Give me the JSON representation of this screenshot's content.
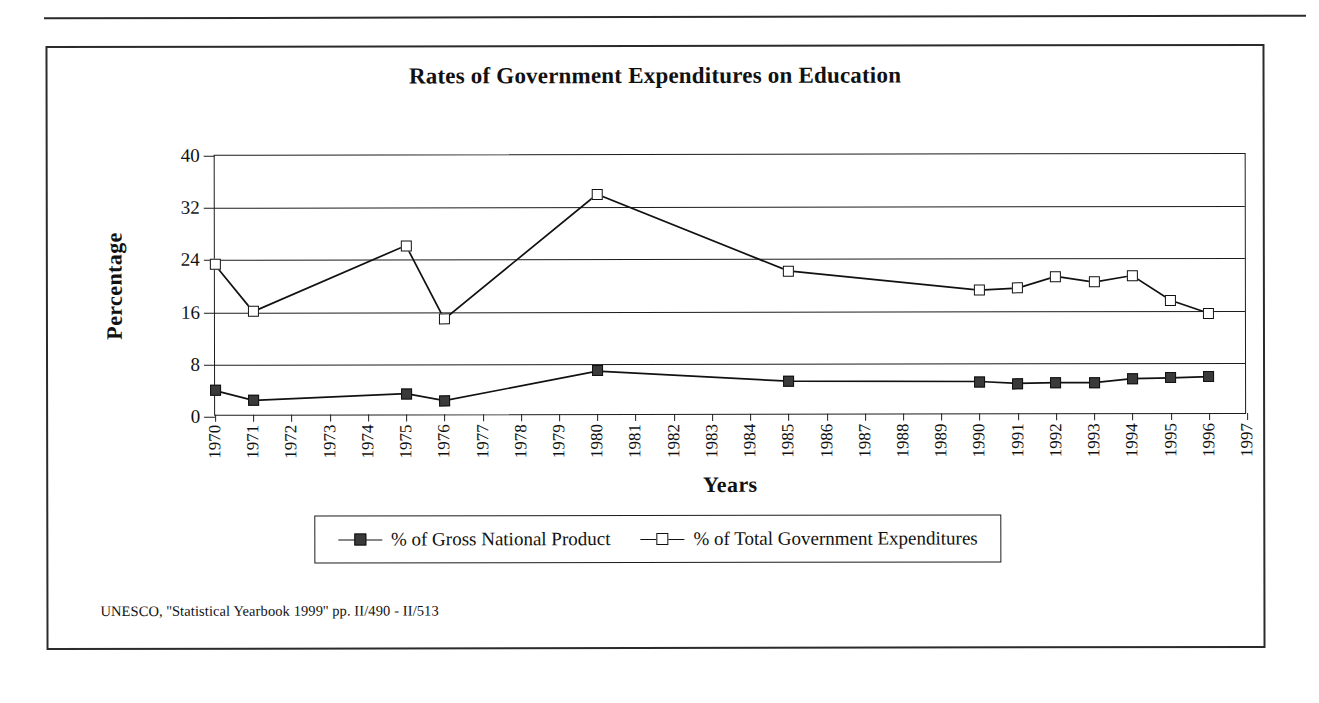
{
  "document": {
    "source_note": "UNESCO, ''Statistical Yearbook 1999'' pp. II/490 - II/513"
  },
  "chart_data": {
    "type": "line",
    "title": "Rates of Government Expenditures on Education",
    "xlabel": "Years",
    "ylabel": "Percentage",
    "ylim": [
      0,
      40
    ],
    "yticks": [
      0,
      8,
      16,
      24,
      32,
      40
    ],
    "grid": true,
    "legend_position": "bottom",
    "categories": [
      "1970",
      "1971",
      "1972",
      "1973",
      "1974",
      "1975",
      "1976",
      "1977",
      "1978",
      "1979",
      "1980",
      "1981",
      "1982",
      "1983",
      "1984",
      "1985",
      "1986",
      "1987",
      "1988",
      "1989",
      "1990",
      "1991",
      "1992",
      "1993",
      "1994",
      "1995",
      "1996",
      "1997"
    ],
    "series": [
      {
        "name": "% of Gross National Product",
        "marker": "filled-square",
        "color": "#3a3a3a",
        "values": [
          4.0,
          2.5,
          null,
          null,
          null,
          3.5,
          2.4,
          null,
          null,
          null,
          6.9,
          null,
          null,
          null,
          null,
          5.3,
          null,
          null,
          null,
          null,
          5.2,
          4.9,
          5.0,
          5.0,
          5.6,
          5.7,
          5.9,
          null
        ]
      },
      {
        "name": "% of Total Government Expenditures",
        "marker": "open-square",
        "color": "#ffffff",
        "values": [
          23.3,
          16.1,
          null,
          null,
          null,
          26.2,
          14.9,
          null,
          null,
          null,
          34.0,
          null,
          null,
          null,
          null,
          22.2,
          null,
          null,
          null,
          null,
          19.2,
          19.5,
          21.3,
          20.4,
          21.4,
          17.6,
          15.6,
          null
        ]
      }
    ]
  }
}
